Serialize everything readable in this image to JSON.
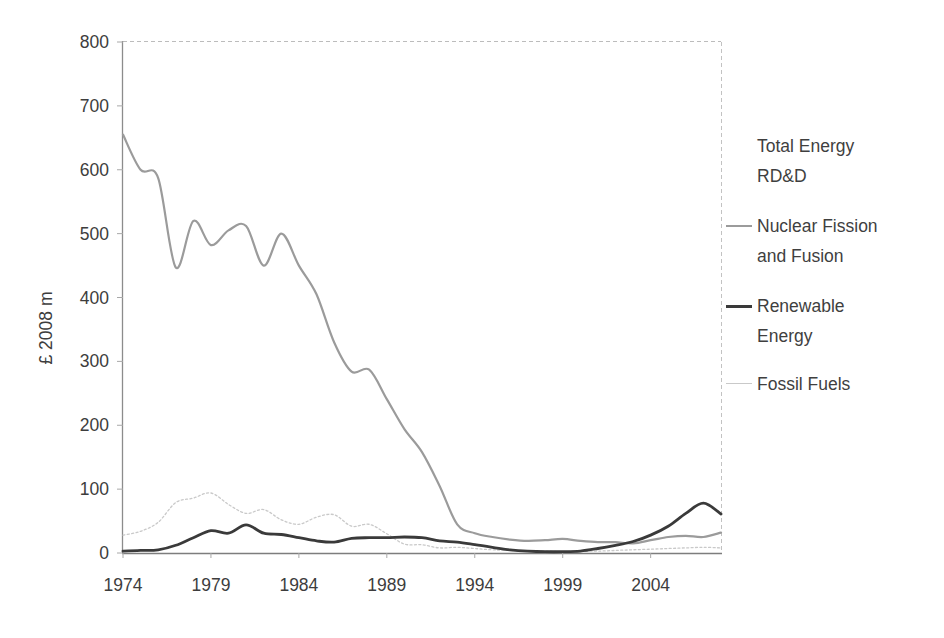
{
  "figure": {
    "background": "#ffffff",
    "text_color": "#3d3d3d",
    "axis_color": "#8c8c8c"
  },
  "chart_data": {
    "type": "line",
    "title": "",
    "xlabel": "",
    "ylabel": "£ 2008 m",
    "xlim": [
      1974,
      2008
    ],
    "ylim": [
      0,
      800
    ],
    "x_tick_labels": [
      "1974",
      "1979",
      "1984",
      "1989",
      "1994",
      "1999",
      "2004"
    ],
    "y_tick_labels": [
      "0",
      "100",
      "200",
      "300",
      "400",
      "500",
      "600",
      "700",
      "800"
    ],
    "grid": "off",
    "frame": {
      "left": "solid",
      "bottom": "solid",
      "top": "dashed",
      "right": "dashed"
    },
    "legend_position": "right",
    "legend": [
      {
        "label": "Total Energy RD&D",
        "lines": [
          "Total Energy",
          "RD&D"
        ],
        "swatch": false,
        "color": null
      },
      {
        "label": "Nuclear Fission and Fusion",
        "lines": [
          "Nuclear Fission",
          "and Fusion"
        ],
        "swatch": true,
        "color": "#9b9b9b"
      },
      {
        "label": "Renewable Energy",
        "lines": [
          "Renewable",
          "Energy"
        ],
        "swatch": true,
        "color": "#3a3a3a"
      },
      {
        "label": "Fossil Fuels",
        "lines": [
          "Fossil Fuels"
        ],
        "swatch": true,
        "color": "#c9c9c9"
      }
    ],
    "x": [
      1974,
      1975,
      1976,
      1977,
      1978,
      1979,
      1980,
      1981,
      1982,
      1983,
      1984,
      1985,
      1986,
      1987,
      1988,
      1989,
      1990,
      1991,
      1992,
      1993,
      1994,
      1995,
      1996,
      1997,
      1998,
      1999,
      2000,
      2001,
      2002,
      2003,
      2004,
      2005,
      2006,
      2007,
      2008
    ],
    "series": [
      {
        "name": "Fossil Fuels",
        "color": "#c9c9c9",
        "stroke_width": 1.3,
        "dash": "2 2.4",
        "values": [
          28,
          34,
          48,
          79,
          86,
          94,
          76,
          62,
          68,
          52,
          45,
          56,
          60,
          42,
          45,
          30,
          14,
          13,
          8,
          9,
          7,
          5,
          4,
          3,
          3,
          2,
          3,
          3,
          4,
          5,
          6,
          7,
          8,
          9,
          8
        ]
      },
      {
        "name": "Nuclear Fission and Fusion",
        "color": "#9b9b9b",
        "stroke_width": 2.2,
        "dash": null,
        "values": [
          655,
          600,
          587,
          447,
          520,
          482,
          505,
          512,
          450,
          500,
          450,
          405,
          330,
          284,
          287,
          241,
          194,
          158,
          105,
          45,
          31,
          25,
          21,
          19,
          20,
          22,
          19,
          17,
          17,
          15,
          20,
          25,
          27,
          25,
          32
        ]
      },
      {
        "name": "Renewable Energy",
        "color": "#3a3a3a",
        "stroke_width": 2.8,
        "dash": null,
        "values": [
          3,
          4,
          5,
          12,
          24,
          35,
          31,
          44,
          31,
          29,
          24,
          19,
          17,
          23,
          24,
          24,
          25,
          24,
          19,
          17,
          13,
          9,
          5,
          3,
          2,
          2,
          3,
          7,
          12,
          18,
          28,
          42,
          62,
          78,
          61
        ]
      }
    ]
  }
}
